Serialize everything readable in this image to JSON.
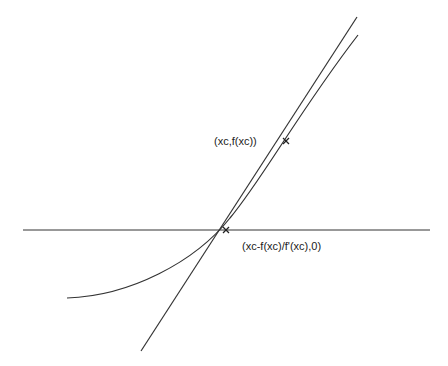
{
  "diagram": {
    "type": "newton-method-tangent",
    "labels": {
      "tangent_point": "(xc,f(xc))",
      "x_intercept": "(xc-f(xc)/f'(xc),0)"
    },
    "points": {
      "tangent_point": [
        286,
        141
      ],
      "x_intercept": [
        226,
        230
      ]
    },
    "axis": {
      "x1": 23,
      "x2": 430,
      "y": 230
    },
    "tangent_line": {
      "x1": 141,
      "y1": 351,
      "x2": 357,
      "y2": 17
    },
    "curve_path": "M 67 298 C 130 296, 195 262, 230 218 C 262 180, 300 110, 358 35",
    "colors": {
      "stroke": "#333333",
      "background": "#ffffff",
      "text": "#222222"
    }
  }
}
